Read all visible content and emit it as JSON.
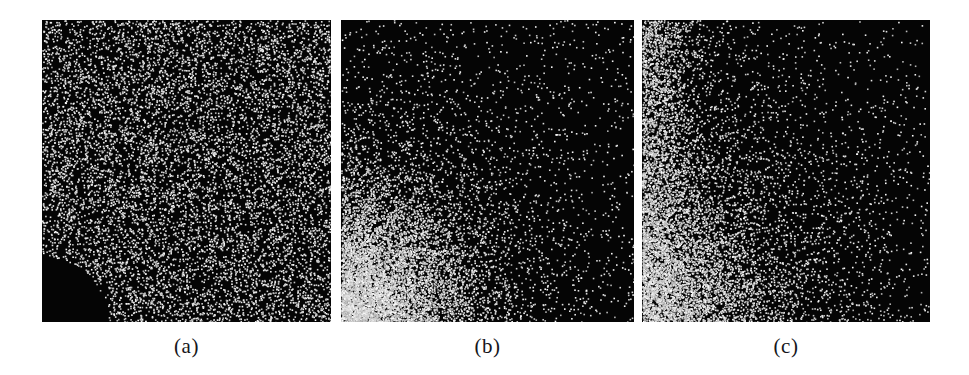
{
  "figure": {
    "background_color": "#ffffff",
    "panel_background_color": "#050505",
    "particle_color": "#ffffff",
    "caption_color": "#16161a"
  },
  "chart_data": {
    "type": "scatter",
    "title": "",
    "subtitle": "",
    "xlabel": "",
    "ylabel": "",
    "grid": false,
    "legend": "none",
    "panels": [
      {
        "id": "a",
        "label": "(a)",
        "x": 42,
        "y": 20,
        "width": 289,
        "height": 302,
        "distribution": "uniform",
        "point_count": 9000,
        "point_size_px": 1.6,
        "density_peak_corner": "none",
        "notch": {
          "shape": "quarter-circle",
          "corner": "bottom-left",
          "center_x": 0,
          "center_y": 302,
          "radius": 66
        }
      },
      {
        "id": "b",
        "label": "(b)",
        "x": 341,
        "y": 20,
        "width": 293,
        "height": 302,
        "distribution": "radial-gradient-decay",
        "point_count": 9000,
        "point_size_px": 1.6,
        "density_peak_corner": "bottom-left",
        "density_peak_x": 0.0,
        "density_peak_y": 1.0,
        "decay_scale": 0.42,
        "decay_exponent": 1.35,
        "notch": null
      },
      {
        "id": "c",
        "label": "(c)",
        "x": 642,
        "y": 20,
        "width": 288,
        "height": 302,
        "distribution": "edge-gradient-decay",
        "point_count": 9000,
        "point_size_px": 1.6,
        "density_peak_corner": "bottom-left-and-left-edge",
        "density_peak_x": 0.0,
        "density_peak_y": 1.0,
        "decay_scale": 0.52,
        "decay_exponent": 1.1,
        "edge_band_weight": 0.45,
        "notch": null
      }
    ]
  },
  "captions": {
    "a": "(a)",
    "b": "(b)",
    "c": "(c)"
  }
}
